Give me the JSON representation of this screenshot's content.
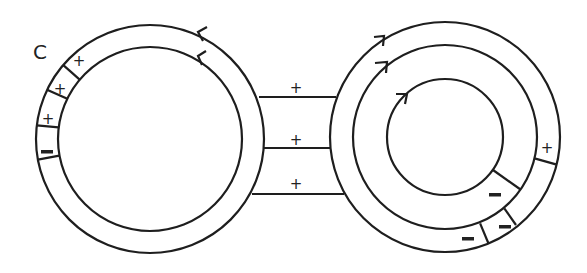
{
  "diagram": {
    "label": "C",
    "stroke_color": "#1e1e1e",
    "left_torus": {
      "center": [
        150,
        139
      ],
      "outer_radius": 114,
      "inner_radius": 92,
      "segment_signs": [
        "+",
        "+",
        "+",
        "-"
      ],
      "arrows": 2
    },
    "right_torus": {
      "center": [
        445,
        137
      ],
      "outer_radius": 115,
      "middle_radius": 92,
      "inner_radius": 58,
      "outer_ring_signs": [
        "+",
        "-",
        "-"
      ],
      "inner_ring_sign": "-",
      "arrows": 3
    },
    "bridges": {
      "signs": [
        "+",
        "+",
        "+"
      ]
    }
  }
}
